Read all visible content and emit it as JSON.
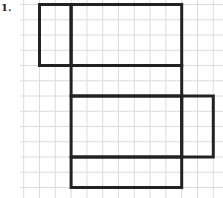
{
  "problem": {
    "number_label": "1."
  },
  "grid": {
    "description": "square grid paper",
    "line_color": "#dcdcdc",
    "outline_color": "#222222"
  },
  "net": {
    "description": "net of a rectangular box drawn on grid (units = grid squares)",
    "faces": [
      {
        "name": "left-flap",
        "col": 0,
        "row": 0,
        "width": 2,
        "height": 4
      },
      {
        "name": "top-face",
        "col": 2,
        "row": 0,
        "width": 7,
        "height": 4
      },
      {
        "name": "upper-middle-face",
        "col": 2,
        "row": 4,
        "width": 7,
        "height": 2
      },
      {
        "name": "center-face",
        "col": 2,
        "row": 6,
        "width": 7,
        "height": 4
      },
      {
        "name": "right-flap",
        "col": 9,
        "row": 6,
        "width": 2,
        "height": 4
      },
      {
        "name": "bottom-face",
        "col": 2,
        "row": 10,
        "width": 7,
        "height": 2
      }
    ]
  }
}
